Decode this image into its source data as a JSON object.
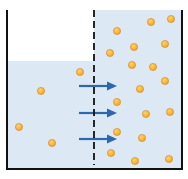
{
  "diagram": {
    "colors": {
      "water": "#dce8f3",
      "wall": "#111111",
      "membrane": "#111111",
      "particle": "#f0a526",
      "particle_edge": "#d9861a",
      "arrow": "#2f67ad",
      "background": "#ffffff"
    },
    "container": {
      "left": 7,
      "right": 182,
      "top": 10,
      "bottom": 169
    },
    "membrane": {
      "x": 94,
      "top": 10,
      "bottom": 165
    },
    "left_compartment": {
      "label": "dilute solution",
      "water_level_y": 61,
      "particles": [
        {
          "x": 80,
          "y": 72
        },
        {
          "x": 41,
          "y": 91
        },
        {
          "x": 19,
          "y": 127
        },
        {
          "x": 52,
          "y": 143
        }
      ]
    },
    "right_compartment": {
      "label": "concentrated solution",
      "water_level_y": 10,
      "particles": [
        {
          "x": 117,
          "y": 31
        },
        {
          "x": 151,
          "y": 22
        },
        {
          "x": 171,
          "y": 19
        },
        {
          "x": 110,
          "y": 53
        },
        {
          "x": 134,
          "y": 47
        },
        {
          "x": 165,
          "y": 44
        },
        {
          "x": 132,
          "y": 65
        },
        {
          "x": 153,
          "y": 67
        },
        {
          "x": 165,
          "y": 81
        },
        {
          "x": 140,
          "y": 89
        },
        {
          "x": 117,
          "y": 102
        },
        {
          "x": 146,
          "y": 114
        },
        {
          "x": 170,
          "y": 112
        },
        {
          "x": 117,
          "y": 132
        },
        {
          "x": 142,
          "y": 138
        },
        {
          "x": 111,
          "y": 153
        },
        {
          "x": 135,
          "y": 161
        },
        {
          "x": 169,
          "y": 159
        }
      ]
    },
    "arrows": [
      {
        "x1": 79,
        "x2": 117,
        "y": 86,
        "meaning": "water flow"
      },
      {
        "x1": 79,
        "x2": 117,
        "y": 113,
        "meaning": "water flow"
      },
      {
        "x1": 79,
        "x2": 117,
        "y": 139,
        "meaning": "water flow"
      }
    ]
  }
}
